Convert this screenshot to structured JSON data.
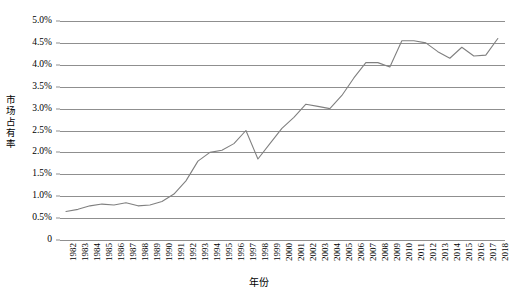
{
  "chart_data": {
    "type": "line",
    "title": "",
    "xlabel": "年份",
    "ylabel": "市场占有率",
    "grid": true,
    "legend": "none",
    "xlim": [
      1982,
      2018
    ],
    "ylim": [
      0,
      5
    ],
    "y_unit": "%",
    "y_ticks": [
      0,
      0.5,
      1.0,
      1.5,
      2.0,
      2.5,
      3.0,
      3.5,
      4.0,
      4.5,
      5.0
    ],
    "y_tick_labels": [
      "0",
      "0.5%",
      "1.0%",
      "1.5%",
      "2.0%",
      "2.5%",
      "3.0%",
      "3.5%",
      "4.0%",
      "4.5%",
      "5.0%"
    ],
    "categories": [
      "1982",
      "1983",
      "1984",
      "1985",
      "1986",
      "1987",
      "1988",
      "1989",
      "1990",
      "1991",
      "1992",
      "1993",
      "1994",
      "1995",
      "1996",
      "1997",
      "1998",
      "1999",
      "2000",
      "2001",
      "2002",
      "2003",
      "2004",
      "2005",
      "2006",
      "2007",
      "2008",
      "2009",
      "2010",
      "2011",
      "2012",
      "2013",
      "2014",
      "2015",
      "2016",
      "2017",
      "2018"
    ],
    "series": [
      {
        "name": "市场占有率",
        "color": "#808080",
        "values": [
          0.65,
          0.7,
          0.78,
          0.82,
          0.8,
          0.85,
          0.78,
          0.8,
          0.88,
          1.05,
          1.35,
          1.8,
          2.0,
          2.05,
          2.2,
          2.5,
          1.85,
          2.2,
          2.55,
          2.8,
          3.1,
          3.05,
          3.0,
          3.3,
          3.7,
          4.05,
          4.05,
          3.95,
          4.55,
          4.55,
          4.5,
          4.3,
          4.15,
          4.4,
          4.2,
          4.22,
          4.6
        ]
      }
    ]
  }
}
